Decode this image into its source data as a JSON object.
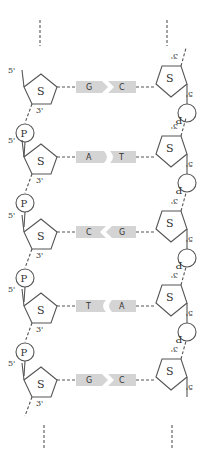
{
  "diagram": {
    "type": "dna-double-strand",
    "labels": {
      "sugar": "S",
      "phosphate": "P",
      "five_prime": "5'",
      "three_prime": "3'"
    },
    "base_pairs": [
      {
        "left": "G",
        "right": "C"
      },
      {
        "left": "A",
        "right": "T"
      },
      {
        "left": "C",
        "right": "G"
      },
      {
        "left": "T",
        "right": "A"
      },
      {
        "left": "G",
        "right": "C"
      }
    ],
    "colors": {
      "base_fill": "#d4d4d4",
      "line": "#555555"
    }
  }
}
